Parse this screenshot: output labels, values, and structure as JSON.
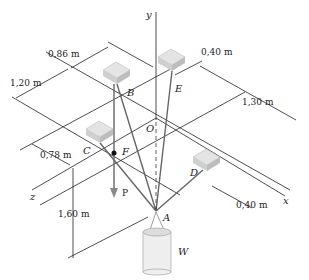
{
  "figure": {
    "axes": {
      "x": "x",
      "y": "y",
      "z": "z"
    },
    "points": {
      "A": "A",
      "B": "B",
      "C": "C",
      "D": "D",
      "E": "E",
      "F": "F",
      "O": "O"
    },
    "force_label": "P",
    "weight_label": "W",
    "dimensions": {
      "d_086": "0,86 m",
      "d_120": "1,20 m",
      "d_040_top": "0,40 m",
      "d_130": "1,30 m",
      "d_078": "0,78 m",
      "d_160": "1,60 m",
      "d_040_bottom": "0,40 m"
    },
    "colors": {
      "lines": "#222222",
      "cables": "#666666",
      "blocks": "#dddddd",
      "force_arrow": "#888888"
    }
  }
}
